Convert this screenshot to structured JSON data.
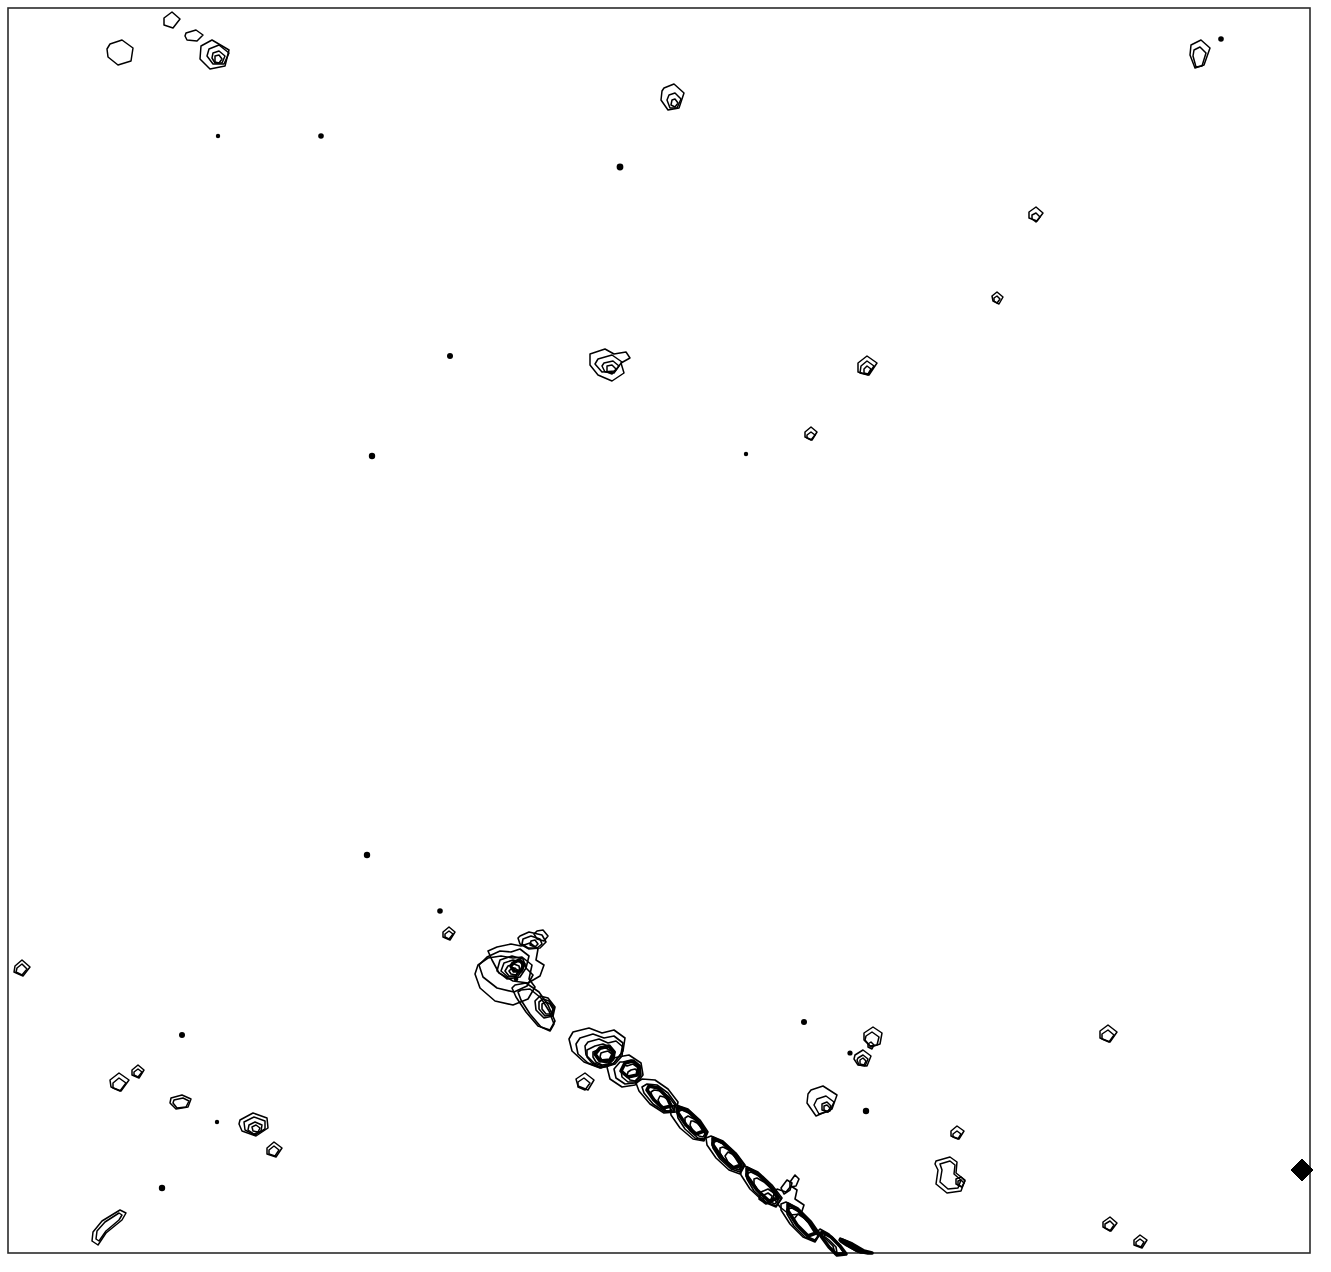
{
  "figure": {
    "kind": "contour-map",
    "title": "",
    "background_color": "#ffffff",
    "line_color": "#000000",
    "frame_color": "#2b2b2b",
    "width": 1331,
    "height": 1272,
    "axis_labels_visible": false,
    "tick_labels_visible": false,
    "legend_visible": false
  },
  "chart_data": {
    "type": "line",
    "title": "",
    "subtitle": "",
    "xlabel": "",
    "ylabel": "",
    "xlim": [
      8,
      1310
    ],
    "ylim": [
      8,
      1253
    ],
    "grid": false,
    "legend": "none",
    "frame": {
      "x": 8,
      "y": 8,
      "width": 1302,
      "height": 1245,
      "stroke_width": 1.6
    },
    "series": [
      {
        "name": "frame",
        "role": "plot-border",
        "paths": [
          "M8 8 L1310 8 L1310 1253 L8 1253 Z"
        ]
      },
      {
        "name": "compact-contour-islands",
        "role": "closed-contours",
        "count": 46,
        "paths": [
          "M164 18 l8 -6 l8 7 l-7 9 l-9 -3 Z",
          "M186 33 l10 -3 l7 5 l-6 6 l-10 -1 l-2 -4 Z",
          "M201 46 l11 -6 l17 10 l-4 16 l-15 3 l-10 -10 Z",
          "M209 49 l10 -4 l10 8 l-5 11 l-11 0 l-6 -8 Z",
          "M213 53 l6 -2 l6 5 l-3 7 l-7 0 l-3 -5 Z",
          "M215 56 l4 -1 l3 4 l-3 4 l-4 -1 Z",
          "M110 44 l12 -4 l11 8 l-2 13 l-13 4 l-10 -8 l-1 -8 Z",
          "M664 88 l10 -4 l10 9 l-5 15 l-11 2 l-7 -10 l1 -9 Z",
          "M669 95 l6 -2 l6 6 l-4 9 l-7 0 l-3 -8 Z",
          "M672 100 l3 -1 l3 4 l-3 4 l-4 -2 Z",
          "M1191 45 l10 -5 l9 8 l-6 17 l-9 3 l-5 -13 Z",
          "M1194 50 l6 -3 l6 6 l-4 13 l-6 1 l-3 -11 Z",
          "M1029 212 l7 -5 l7 6 l-6 8 l-8 -3 Z",
          "M1032 215 l4 -2 l4 4 l-4 5 l-4 -3 Z",
          "M992 296 l5 -4 l6 5 l-4 7 l-6 -3 Z",
          "M994 298 l3 -2 l3 3 l-3 4 l-3 -2 Z",
          "M590 354 l15 -5 l9 5 l12 -2 l4 6 l-9 5 l3 10 l-12 8 l-14 -6 l-8 -10 Z",
          "M598 359 l14 -4 l10 7 l-7 9 l-13 1 l-7 -8 Z",
          "M604 363 l9 -2 l6 5 l-5 7 l-9 -1 l-3 -6 Z",
          "M607 366 l5 -1 l4 4 l-4 5 l-5 -2 Z",
          "M858 363 l9 -7 l10 7 l-8 12 l-11 -3 Z",
          "M861 366 l6 -5 l7 5 l-6 9 l-8 -2 Z",
          "M864 369 l3 -3 l4 3 l-3 5 l-4 -1 Z",
          "M805 432 l6 -5 l6 5 l-5 8 l-7 -3 Z",
          "M807 435 l4 -3 l4 3 l-4 5 l-4 -2 Z",
          "M15 966 l7 -6 l8 7 l-7 9 l-9 -4 Z",
          "M17 968 l5 -4 l5 5 l-5 6 l-6 -3 Z",
          "M443 932 l6 -5 l6 5 l-5 8 l-7 -3 Z",
          "M445 934 l4 -3 l4 3 l-4 5 l-4 -2 Z",
          "M110 1080 l9 -7 l10 7 l-8 11 l-10 -4 Z",
          "M113 1083 l6 -5 l7 5 l-6 8 l-7 -3 Z",
          "M132 1070 l6 -5 l6 5 l-5 8 l-7 -3 Z",
          "M134 1072 l4 -3 l4 3 l-4 5 l-4 -2 Z",
          "M171 1098 l11 -3 l9 4 l-3 8 l-12 2 l-6 -6 Z",
          "M174 1100 l9 -2 l6 3 l-3 6 l-9 1 l-4 -5 Z",
          "M240 1120 l13 -7 l14 5 l1 10 l-12 8 l-14 -5 l-3 -7 Z",
          "M244 1122 l10 -5 l11 4 l0 8 l-10 6 l-10 -5 Z",
          "M249 1125 l6 -3 l7 3 l-1 6 l-7 3 l-6 -4 Z",
          "M252 1127 l4 -2 l4 3 l-2 4 l-5 -1 Z",
          "M267 1148 l7 -6 l8 6 l-6 9 l-9 -3 Z",
          "M269 1150 l5 -4 l5 4 l-4 6 l-6 -2 Z",
          "M864 1033 l9 -6 l9 6 l-2 11 l-9 3 l-7 -7 Z",
          "M866 1036 l6 -4 l7 5 l-2 8 l-7 1 l-5 -6 Z",
          "M855 1055 l8 -5 l8 6 l-4 10 l-9 -1 l-4 -6 Z",
          "M858 1058 l5 -3 l5 4 l-3 7 l-6 -1 l-2 -5 Z",
          "M860 1060 l3 -2 l3 3 l-2 4 l-4 -1 Z",
          "M868 1044 l3 -2 l3 3 l-2 4 l-4 -2 Z",
          "M811 1090 l12 -4 l14 9 l-5 14 l-16 7 l-9 -13 l1 -9 Z",
          "M817 1099 l9 -3 l8 6 l-4 9 l-11 3 l-5 -9 Z",
          "M822 1104 l5 -2 l4 4 l-3 6 l-6 -2 Z",
          "M824 1106 l3 -1 l3 3 l-2 4 l-4 -2 Z",
          "M1100 1031 l8 -6 l9 7 l-7 10 l-10 -4 Z",
          "M1102 1034 l6 -4 l6 5 l-5 7 l-7 -3 Z",
          "M951 1131 l6 -5 l7 5 l-5 8 l-8 -3 Z",
          "M953 1134 l4 -3 l4 3 l-3 5 l-5 -2 Z",
          "M936 1161 l14 -4 l7 5 l-1 11 l9 7 l-4 11 l-14 2 l-11 -9 l2 -14 l-3 -6 Z",
          "M940 1164 l10 -3 l5 4 l-1 9 l7 6 l-3 8 l-10 1 l-8 -7 l2 -12 Z",
          "M956 1179 l5 -2 l4 4 l-3 6 l-6 -3 Z",
          "M958 1181 l3 -1 l3 3 l-2 4 l-4 -2 Z",
          "M1103 1222 l7 -5 l7 6 l-6 8 l-8 -4 Z",
          "M1105 1224 l5 -3 l4 4 l-4 6 l-5 -3 Z",
          "M1134 1240 l6 -5 l7 5 l-5 8 l-8 -3 Z",
          "M1136 1242 l4 -3 l4 3 l-3 5 l-5 -2 Z",
          "M93 1232 l9 -11 l18 -11 l6 3 l-4 7 l-16 13 l-8 12 l-6 -4 l1 -9 Z",
          "M97 1231 l8 -9 l14 -9 l3 2 l-3 5 l-13 11 l-7 10 l-3 -2 Z",
          "M576 1079 l9 -6 l9 7 l-6 10 l-10 -4 Z",
          "M578 1082 l6 -4 l6 5 l-5 7 l-7 -3 Z"
        ]
      },
      {
        "name": "point-sources",
        "role": "unresolved-dots",
        "count": 16,
        "dots": [
          {
            "cx": 218,
            "cy": 136,
            "r": 2.2
          },
          {
            "cx": 321,
            "cy": 136,
            "r": 2.8
          },
          {
            "cx": 620,
            "cy": 167,
            "r": 3.4
          },
          {
            "cx": 1221,
            "cy": 39,
            "r": 2.8
          },
          {
            "cx": 450,
            "cy": 356,
            "r": 3.0
          },
          {
            "cx": 372,
            "cy": 456,
            "r": 3.2
          },
          {
            "cx": 746,
            "cy": 454,
            "r": 2.2
          },
          {
            "cx": 367,
            "cy": 855,
            "r": 3.2
          },
          {
            "cx": 440,
            "cy": 911,
            "r": 2.8
          },
          {
            "cx": 182,
            "cy": 1035,
            "r": 3.0
          },
          {
            "cx": 217,
            "cy": 1122,
            "r": 2.2
          },
          {
            "cx": 162,
            "cy": 1188,
            "r": 3.2
          },
          {
            "cx": 804,
            "cy": 1022,
            "r": 3.0
          },
          {
            "cx": 850,
            "cy": 1053,
            "r": 2.6
          },
          {
            "cx": 866,
            "cy": 1111,
            "r": 3.2
          },
          {
            "cx": 516,
            "cy": 979,
            "r": 2.4
          }
        ]
      },
      {
        "name": "diagonal-filament-ridge",
        "role": "extended-structure",
        "orientation": "upper-left to lower-right",
        "start_point": [
          512,
          935
        ],
        "end_point": [
          872,
          1253
        ],
        "outer_paths": [
          "M537 931 l6 -1 l5 6 l-4 5 l-7 -2 l-3 -5 Z",
          "M520 936 l9 -4 l13 3 l4 7 l-6 6 l-11 1 l-9 -5 l-2 -6 Z",
          "M523 939 l8 -3 l9 3 l2 5 l-5 4 l-9 0 l-6 -4 Z",
          "M531 941 l4 -1 l3 4 l-3 3 l-5 -2 Z",
          "M497 947 l14 -3 l10 2 l9 -3 l8 6 l-2 11 l8 5 l-4 11 l-12 7 l-15 -2 l-14 -8 l-7 -13 l-4 -9 l9 -4 Z",
          "M487 957 l13 -6 l11 1 l9 -3 l9 7 l-3 12 l7 7 l-6 11 l-13 6 l-17 -4 l-14 -11 l-4 -12 l8 -8 Z",
          "M478 965 l10 -7 l13 -2 l12 2 l9 -1 l10 8 l-3 14 l6 8 l-7 12 l-15 6 l-18 -4 l-15 -13 l-5 -14 l3 -9 Z",
          "M500 960 l12 -4 l11 3 l3 9 l-6 9 l-13 2 l-10 -8 l3 -11 Z",
          "M504 963 l9 -3 l8 2 l2 7 l-5 7 l-10 1 l-7 -6 l3 -8 Z",
          "M508 966 l6 -2 l5 2 l1 5 l-4 5 l-7 0 l-4 -5 Z",
          "M511 969 l4 -1 l3 3 l-2 4 l-5 -1 l-2 -3 Z",
          "M515 985 l11 -2 l13 9 l9 13 l7 16 l-5 9 l-12 -4 l-12 -14 l-10 -15 l-4 -9 l3 -3 Z",
          "M521 990 l9 -1 l11 9 l8 13 l5 13 l-4 7 l-9 -4 l-11 -13 l-9 -14 l-3 -8 Z",
          "M540 996 l8 2 l7 9 l-2 9 l-9 2 l-8 -8 l-1 -9 l5 -5 Z",
          "M543 999 l6 2 l5 7 l-2 7 l-7 1 l-6 -7 l0 -7 l4 -3 Z",
          "M546 1002 l4 2 l3 5 l-2 5 l-5 0 l-4 -5 l0 -5 Z",
          "M573 1032 l16 -4 l13 5 l12 -3 l11 8 l-2 13 l-9 12 l-14 5 l-16 -6 l-12 -11 l-3 -12 l4 -7 Z",
          "M580 1038 l13 -4 l11 4 l10 -2 l9 7 l-2 11 l-8 10 l-12 4 l-13 -5 l-10 -9 l-2 -10 l4 -6 Z",
          "M588 1042 l11 -3 l9 4 l8 -2 l7 6 l-1 9 l-7 8 l-10 3 l-11 -4 l-8 -8 l-1 -9 l3 -4 Z",
          "M595 1046 l8 -2 l7 3 l5 5 l-1 7 l-6 6 l-8 2 l-8 -4 l-5 -6 l0 -7 l8 -4 Z",
          "M600 1049 l6 -1 l5 3 l3 4 l-1 5 l-5 4 l-6 1 l-6 -3 l-3 -5 l0 -5 Z",
          "M604 1052 l4 -1 l4 3 l0 5 l-4 4 l-5 -1 l-3 -5 l1 -4 Z",
          "M618 1057 l11 -2 l12 8 l2 12 l-8 10 l-13 2 l-12 -8 l-3 -12 l7 -9 Z",
          "M623 1062 l8 -2 l9 6 l1 9 l-6 8 l-10 1 l-9 -6 l-2 -9 l6 -7 Z",
          "M627 1066 l6 -2 l7 5 l0 7 l-5 6 l-7 0 l-6 -5 l-1 -7 l4 -5 Z",
          "M631 1070 l4 -1 l4 3 l0 5 l-4 4 l-5 -1 l-3 -4 l1 -4 Z",
          "M642 1079 l13 1 l13 9 l10 13 l-2 10 l-12 1 l-14 -9 l-11 -13 l-3 -8 l6 -4 Z",
          "M647 1084 l10 1 l11 8 l8 11 l-2 8 l-9 0 l-12 -8 l-9 -11 l-2 -6 l5 -3 Z",
          "M654 1090 l7 1 l8 6 l6 8 l-2 6 l-7 0 l-8 -6 l-6 -8 l-1 -5 l3 -2 Z",
          "M660 1096 l4 1 l5 4 l4 6 l-2 4 l-5 0 l-5 -5 l-3 -6 l2 -4 Z",
          "M676 1105 l12 4 l12 11 l8 12 l-4 9 l-11 -2 l-13 -11 l-9 -13 l-1 -8 l6 -2 Z",
          "M682 1110 l9 4 l10 9 l6 10 l-3 7 l-9 -2 l-10 -9 l-7 -11 l-1 -6 l5 -2 Z",
          "M688 1116 l6 3 l7 7 l5 8 l-2 5 l-6 -1 l-8 -7 l-5 -8 l0 -5 l3 -2 Z",
          "M693 1121 l4 2 l5 5 l3 6 l-2 3 l-4 -1 l-6 -5 l-3 -6 l1 -4 Z",
          "M711 1136 l12 5 l13 12 l9 12 l-5 9 l-11 -4 l-13 -12 l-9 -13 l-1 -7 l5 -2 Z",
          "M717 1141 l9 4 l11 10 l7 10 l-4 7 l-9 -3 l-11 -10 l-7 -11 l-1 -5 l5 -2 Z",
          "M723 1147 l6 3 l8 7 l5 8 l-3 5 l-6 -2 l-8 -7 l-5 -8 l0 -5 l3 -1 Z",
          "M728 1152 l4 2 l5 5 l3 6 l-2 3 l-4 -1 l-6 -5 l-3 -6 l3 -4 Z",
          "M745 1166 l13 6 l14 13 l10 13 l-6 9 l-12 -5 l-14 -13 l-9 -14 l-1 -7 l5 -2 Z",
          "M751 1172 l10 5 l12 11 l8 11 l-5 7 l-10 -4 l-12 -11 l-7 -12 l-1 -5 l5 -2 Z",
          "M757 1178 l7 4 l9 8 l6 9 l-4 5 l-7 -3 l-9 -8 l-5 -9 l0 -5 l3 -1 Z",
          "M777 1189 l9 3 l5 -6 l6 4 l-2 9 l9 6 l-3 9 l-11 1 l-10 -8 l-7 -10 l4 -8 Z",
          "M761 1192 l7 -3 l6 4 l-1 8 l-7 3 l-7 -5 l2 -7 Z",
          "M764 1195 l4 -2 l4 3 l-1 5 l-5 2 l-3 -4 Z",
          "M781 1188 l6 -8 l5 3 l-2 7 l-6 4 l-3 -6 Z",
          "M790 1182 l5 -7 l4 4 l-3 7 l-6 1 l0 -5 Z",
          "M786 1202 l12 6 l13 13 l9 13 l-5 8 l-12 -5 l-13 -13 l-9 -14 l0 -6 l5 -2 Z",
          "M792 1208 l9 5 l11 11 l7 11 l-4 6 l-10 -4 l-11 -11 l-7 -12 l0 -5 l5 -1 Z",
          "M798 1214 l6 4 l9 9 l5 9 l-3 4 l-7 -3 l-9 -9 l-5 -9 l4 -5 Z",
          "M820 1229 l9 5 l9 10 l6 9 l-9 1 l-2 -8 l-9 -9 l-6 -6 l2 -2 Z",
          "M826 1234 l7 4 l7 8 l4 7 l-7 0 l-1 -6 l-7 -7 l-5 -4 l2 -2 Z",
          "M840 1238 l9 4 l13 9 l10 2 l-3 -1 l-8 1 l-5 -2 l-10 -6 l-7 -5 l1 -2 Z"
        ],
        "core_paths": [
          "M513 963 l6 -3 l5 4 l-3 7 l-7 0 l-3 -5 Z",
          "M600 1048 l9 -2 l5 6 l-4 8 l-10 1 l-5 -7 l5 -6 Z",
          "M625 1063 l8 -2 l6 5 l-2 9 l-9 2 l-7 -6 l4 -8 Z",
          "M649 1086 l9 2 l9 9 l4 9 l-8 2 l-9 -8 l-7 -10 l2 -4 Z",
          "M678 1107 l10 4 l10 10 l6 10 l-8 3 l-10 -9 l-8 -12 l0 -6 Z",
          "M713 1138 l10 5 l11 11 l7 11 l-8 3 l-11 -10 l-9 -13 l0 -7 Z",
          "M747 1168 l11 6 l12 12 l8 12 l-9 3 l-12 -11 l-10 -14 l0 -8 Z",
          "M788 1204 l10 6 l11 12 l7 11 l-8 3 l-11 -11 l-9 -14 l0 -7 Z",
          "M822 1232 l9 5 l9 9 l6 8 l-9 1 l-8 -8 l-8 -11 l1 -4 Z",
          "M842 1240 l10 4 l12 7 l8 2 l-4 0 l-10 -2 l-11 -6 l-6 -4 l1 -1 Z"
        ]
      },
      {
        "name": "filled-diamond-marker",
        "role": "reference-marker",
        "fill": "#000000",
        "markers": [
          {
            "cx": 1302,
            "cy": 1170,
            "size": 11,
            "shape": "diamond",
            "filled": true
          }
        ]
      }
    ]
  }
}
